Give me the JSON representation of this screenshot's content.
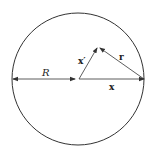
{
  "diagram": {
    "type": "geometry-vector-diagram",
    "circle": {
      "cx": 78,
      "cy": 79,
      "r": 66,
      "stroke": "#333333"
    },
    "labels": {
      "radius": "R",
      "source_vector": "x′",
      "field_vector": "x",
      "difference_vector": "r"
    },
    "vectors": [
      {
        "name": "R",
        "from": [
          12,
          79
        ],
        "to": [
          75,
          79
        ],
        "double_headed": true
      },
      {
        "name": "x",
        "from": [
          79,
          79
        ],
        "to": [
          145,
          79
        ]
      },
      {
        "name": "x′",
        "from": [
          79,
          79
        ],
        "to": [
          98,
          47
        ]
      },
      {
        "name": "r",
        "from": [
          145,
          79
        ],
        "to": [
          98,
          47
        ]
      }
    ],
    "colors": {
      "line": "#333333",
      "text": "#222222",
      "background": "#ffffff"
    }
  }
}
